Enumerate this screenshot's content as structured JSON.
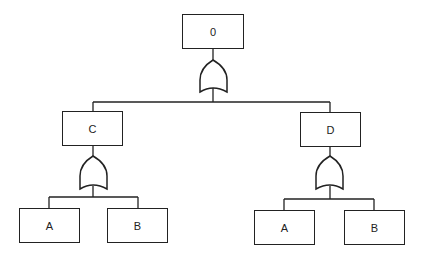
{
  "diagram": {
    "type": "fault-tree",
    "top_event": {
      "label": "0",
      "gate": "OR"
    },
    "intermediate_events": [
      {
        "label": "C",
        "gate": "OR",
        "children": [
          "A",
          "B"
        ]
      },
      {
        "label": "D",
        "gate": "OR",
        "children": [
          "A",
          "B"
        ]
      }
    ],
    "basic_events": {
      "left": [
        {
          "label": "A"
        },
        {
          "label": "B"
        }
      ],
      "right": [
        {
          "label": "A"
        },
        {
          "label": "B"
        }
      ]
    },
    "colors": {
      "line": "#222222",
      "background": "#ffffff"
    }
  }
}
